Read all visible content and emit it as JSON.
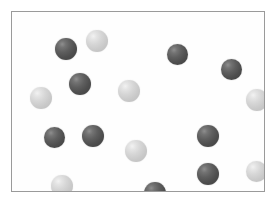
{
  "figure": {
    "title": "",
    "width": 275,
    "height": 208,
    "background_color": "#ffffff"
  },
  "panel": {
    "x": 11,
    "y": 11,
    "width": 254,
    "height": 181,
    "fill_color": "#fefefe",
    "border_color": "#9a9a9a",
    "border_width": 1
  },
  "legend": {
    "dark_label": "dark sphere",
    "light_label": "light sphere",
    "dark_color": "#5e5e5e",
    "light_color": "#d6d6d6"
  },
  "chart_data": {
    "type": "scatter",
    "title": "",
    "xlabel": "",
    "ylabel": "",
    "xlim": [
      0,
      254
    ],
    "ylim": [
      0,
      181
    ],
    "grid": false,
    "legend_position": "none",
    "counts": {
      "dark": 10,
      "light": 8,
      "total": 18
    },
    "series": [
      {
        "name": "dark sphere",
        "color": "#5e5e5e",
        "marker": "sphere",
        "points": [
          {
            "id": "d1",
            "x": 54,
            "y": 37,
            "r": 11
          },
          {
            "id": "d2",
            "x": 68,
            "y": 72,
            "r": 11
          },
          {
            "id": "d3",
            "x": 165,
            "y": 42,
            "r": 10
          },
          {
            "id": "d4",
            "x": 219,
            "y": 57,
            "r": 11
          },
          {
            "id": "d5",
            "x": 42,
            "y": 125,
            "r": 10
          },
          {
            "id": "d6",
            "x": 81,
            "y": 124,
            "r": 11
          },
          {
            "id": "d7",
            "x": 196,
            "y": 124,
            "r": 11
          },
          {
            "id": "d8",
            "x": 196,
            "y": 162,
            "r": 11
          },
          {
            "id": "d9",
            "x": 143,
            "y": 181,
            "r": 11
          },
          {
            "id": "d10",
            "x": 165,
            "y": 42,
            "r": 10
          }
        ]
      },
      {
        "name": "light sphere",
        "color": "#d6d6d6",
        "marker": "sphere",
        "points": [
          {
            "id": "l1",
            "x": 85,
            "y": 29,
            "r": 11
          },
          {
            "id": "l2",
            "x": 29,
            "y": 86,
            "r": 11
          },
          {
            "id": "l3",
            "x": 117,
            "y": 79,
            "r": 11
          },
          {
            "id": "l4",
            "x": 245,
            "y": 88,
            "r": 11
          },
          {
            "id": "l5",
            "x": 124,
            "y": 139,
            "r": 11
          },
          {
            "id": "l6",
            "x": 244,
            "y": 159,
            "r": 11
          },
          {
            "id": "l7",
            "x": 50,
            "y": 174,
            "r": 11
          },
          {
            "id": "l8",
            "x": 85,
            "y": 29,
            "r": 11
          }
        ]
      }
    ],
    "particles": [
      {
        "id": "p1",
        "shade": "dark",
        "cx": 54,
        "cy": 37,
        "d": 22
      },
      {
        "id": "p2",
        "shade": "light",
        "cx": 85,
        "cy": 29,
        "d": 22
      },
      {
        "id": "p3",
        "shade": "dark",
        "cx": 165,
        "cy": 42,
        "d": 21
      },
      {
        "id": "p4",
        "shade": "dark",
        "cx": 219,
        "cy": 57,
        "d": 21
      },
      {
        "id": "p5",
        "shade": "dark",
        "cx": 68,
        "cy": 72,
        "d": 22
      },
      {
        "id": "p6",
        "shade": "light",
        "cx": 117,
        "cy": 79,
        "d": 22
      },
      {
        "id": "p7",
        "shade": "light",
        "cx": 29,
        "cy": 86,
        "d": 22
      },
      {
        "id": "p8",
        "shade": "light",
        "cx": 245,
        "cy": 88,
        "d": 22
      },
      {
        "id": "p9",
        "shade": "dark",
        "cx": 42,
        "cy": 125,
        "d": 21
      },
      {
        "id": "p10",
        "shade": "dark",
        "cx": 81,
        "cy": 124,
        "d": 22
      },
      {
        "id": "p11",
        "shade": "dark",
        "cx": 196,
        "cy": 124,
        "d": 22
      },
      {
        "id": "p12",
        "shade": "light",
        "cx": 124,
        "cy": 139,
        "d": 22
      },
      {
        "id": "p13",
        "shade": "dark",
        "cx": 196,
        "cy": 162,
        "d": 22
      },
      {
        "id": "p14",
        "shade": "light",
        "cx": 244,
        "cy": 159,
        "d": 21
      },
      {
        "id": "p15",
        "shade": "light",
        "cx": 50,
        "cy": 174,
        "d": 22
      },
      {
        "id": "p16",
        "shade": "dark",
        "cx": 143,
        "cy": 181,
        "d": 22
      }
    ]
  }
}
